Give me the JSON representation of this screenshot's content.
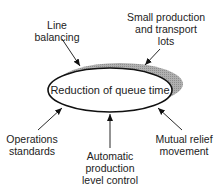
{
  "diagram": {
    "center": {
      "label": "Reduction of queue time"
    },
    "factors": [
      {
        "id": "line-balancing",
        "label": "Line\nbalancing"
      },
      {
        "id": "small-lots",
        "label": "Small production\nand transport\nlots"
      },
      {
        "id": "operations-standards",
        "label": "Operations\nstandards"
      },
      {
        "id": "automatic-control",
        "label": "Automatic\nproduction\nlevel control"
      },
      {
        "id": "mutual-relief",
        "label": "Mutual relief\nmovement"
      }
    ],
    "colors": {
      "stroke": "#111111",
      "shadow": "#a8a8a8",
      "text": "#222222"
    }
  }
}
